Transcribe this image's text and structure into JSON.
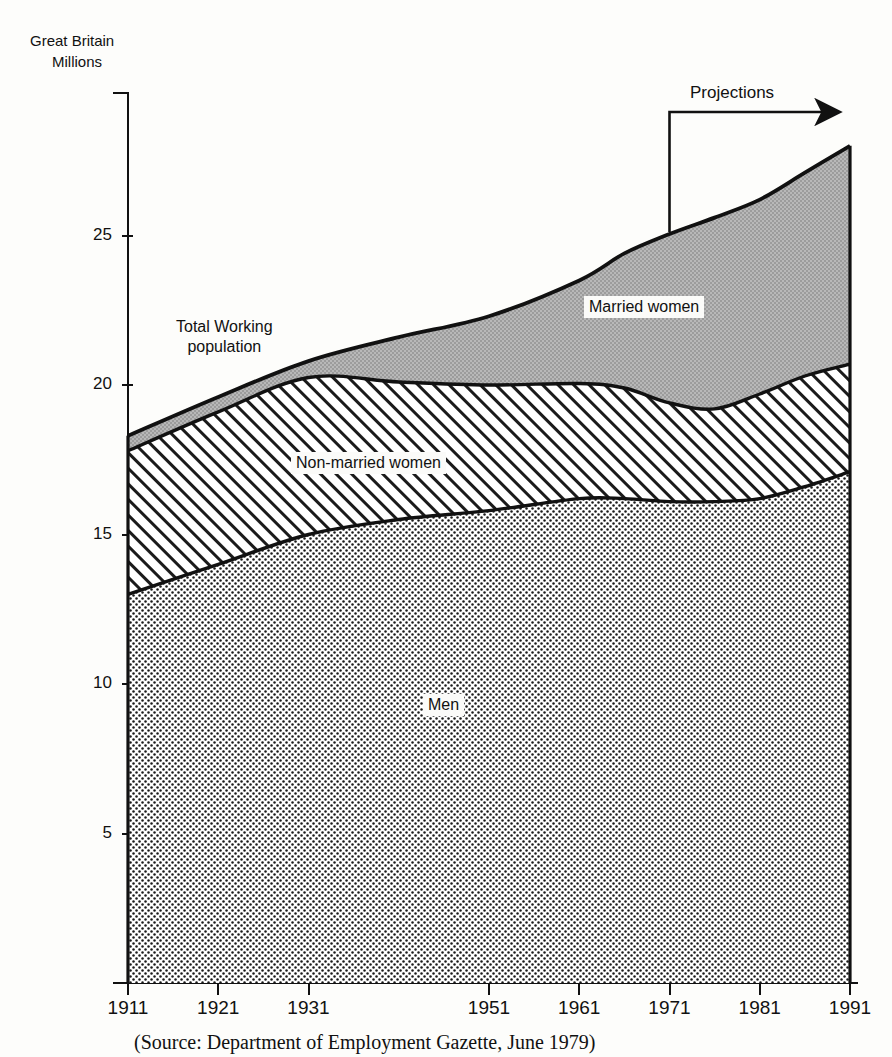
{
  "header": {
    "region_label": "Great Britain",
    "unit_label": "Millions"
  },
  "annotations": {
    "projections_label": "Projections",
    "total_label": "Total Working\npopulation",
    "caption": "(Source: Department of Employment Gazette, June 1979)"
  },
  "chart_data": {
    "type": "area",
    "title": "",
    "subtitle": "",
    "xlabel": "",
    "ylabel": "Millions",
    "region": "Great Britain",
    "stacked": true,
    "grid": false,
    "legend_position": "inline-labels",
    "xlim": [
      1911,
      1991
    ],
    "ylim": [
      0,
      29
    ],
    "xticks": [
      1911,
      1921,
      1931,
      1951,
      1961,
      1971,
      1981,
      1991
    ],
    "xtick_labels": [
      "1911",
      "1921",
      "1931",
      "1951",
      "1961",
      "1971",
      "1981",
      "1991"
    ],
    "yticks": [
      5,
      10,
      15,
      20,
      25
    ],
    "ytick_labels": [
      "5",
      "10",
      "15",
      "20",
      "25"
    ],
    "projection_start_year": 1971,
    "x": [
      1911,
      1921,
      1931,
      1941,
      1951,
      1961,
      1966,
      1971,
      1976,
      1981,
      1986,
      1991
    ],
    "series": [
      {
        "name": "Men",
        "label": "Men",
        "fill": "dots",
        "values": [
          13.0,
          14.0,
          15.0,
          15.5,
          15.8,
          16.2,
          16.2,
          16.1,
          16.1,
          16.2,
          16.6,
          17.1
        ]
      },
      {
        "name": "Non-married women",
        "label": "Non-married women",
        "fill": "diagonal-hatch",
        "cumulative_top": [
          17.8,
          19.1,
          20.25,
          20.1,
          20.0,
          20.05,
          19.9,
          19.4,
          19.2,
          19.7,
          20.3,
          20.7
        ],
        "values": [
          4.8,
          5.1,
          5.25,
          4.6,
          4.2,
          3.85,
          3.7,
          3.3,
          3.1,
          3.5,
          3.7,
          3.6
        ]
      },
      {
        "name": "Married women",
        "label": "Married women",
        "fill": "grey",
        "cumulative_top": [
          18.3,
          19.6,
          20.8,
          21.6,
          22.3,
          23.5,
          24.4,
          25.05,
          25.6,
          26.2,
          27.1,
          28.0
        ],
        "values": [
          0.5,
          0.5,
          0.55,
          1.5,
          2.3,
          3.45,
          4.5,
          5.65,
          6.4,
          6.5,
          6.8,
          7.3
        ]
      }
    ],
    "total_series": {
      "name": "Total Working population",
      "label": "Total Working population",
      "values": [
        18.3,
        19.6,
        20.8,
        21.6,
        22.3,
        23.5,
        24.4,
        25.05,
        25.6,
        26.2,
        27.1,
        28.0
      ]
    }
  },
  "colors": {
    "ink": "#111111",
    "married_fill": "#b3b3b3",
    "men_fill": "#d8d8d8",
    "background": "#fdfdfb"
  }
}
